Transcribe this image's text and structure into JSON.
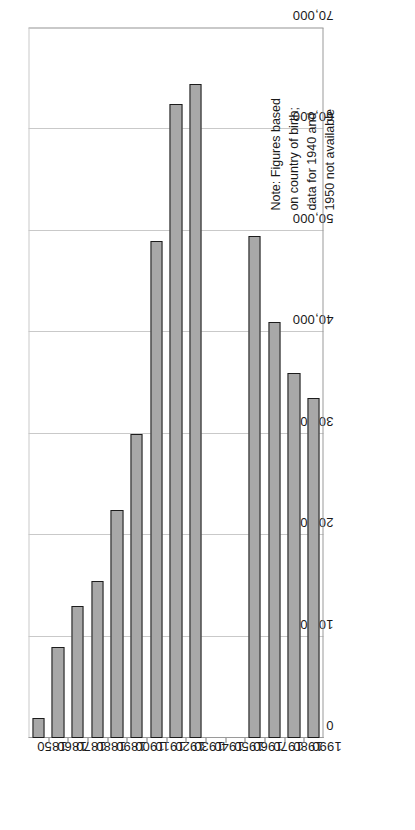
{
  "chart_data": {
    "type": "bar",
    "orientation": "vertical-printed-sideways",
    "title": "",
    "subtitle": "",
    "xlabel": "",
    "ylabel": "",
    "categories": [
      "1850",
      "1860",
      "1870",
      "1880",
      "1890",
      "1900",
      "1910",
      "1920",
      "1930",
      "1940",
      "1950",
      "1960",
      "1970",
      "1980",
      "1990"
    ],
    "values": [
      2000,
      9000,
      13000,
      15500,
      22500,
      30000,
      49000,
      62500,
      64500,
      null,
      null,
      49500,
      41000,
      36000,
      33500
    ],
    "missing_categories": [
      "1940",
      "1950"
    ],
    "ylim": [
      0,
      70000
    ],
    "tick_labels": [
      "0",
      "10,000",
      "20,000",
      "30,000",
      "40,000",
      "50,000",
      "60,000",
      "70,000"
    ],
    "tick_values": [
      0,
      10000,
      20000,
      30000,
      40000,
      50000,
      60000,
      70000
    ],
    "grid": true,
    "legend": false,
    "legend_position": "none",
    "bar_fill": "#a8a8a8",
    "bar_border": "#1c1c1c",
    "grid_color": "#c9c9c9",
    "axis_color": "#9a9a9a",
    "annotations": [
      {
        "name": "data-note",
        "text": "Note: Figures based\non country of birth;\ndata for 1940 and\n1950 not available"
      }
    ]
  },
  "note": {
    "line1": "Note: Figures based",
    "line2": "on country of birth;",
    "line3": "data for 1940 and",
    "line4": "1950 not available",
    "full": "Note: Figures based\non country of birth;\ndata for 1940 and\n1950 not available"
  }
}
